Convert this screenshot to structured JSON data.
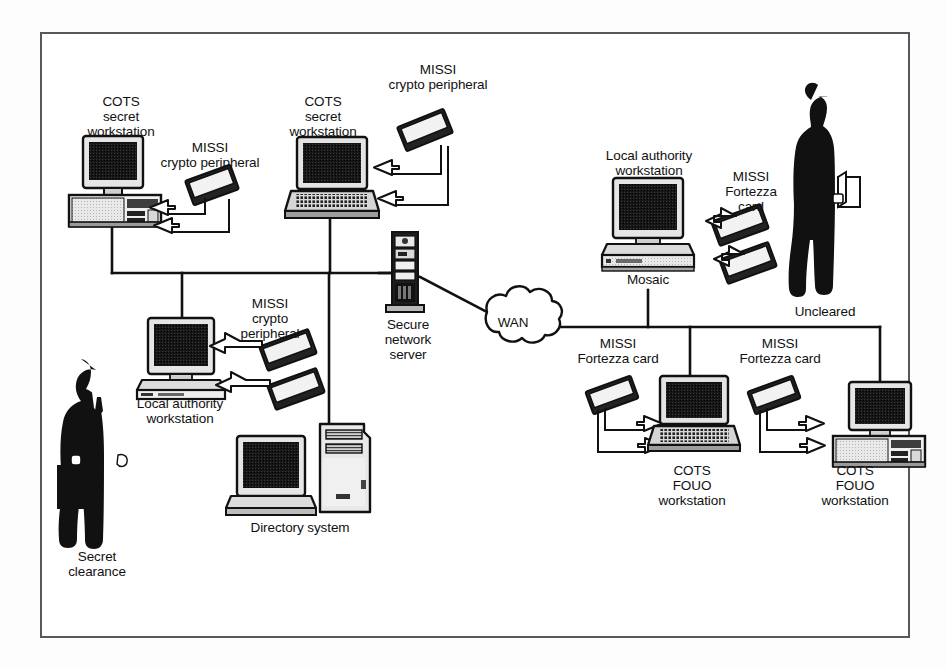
{
  "diagram": {
    "frame": {
      "border_color": "#55585c",
      "background": "#ffffff"
    },
    "ink_color": "#111111",
    "nodes": [
      {
        "id": "cots-secret-ws-desktop",
        "label": "COTS\nsecret\nworkstation",
        "type": "desktop-computer",
        "x": 120,
        "y": 182
      },
      {
        "id": "missi-crypto-1",
        "label": "MISSI\ncrypto peripheral",
        "type": "crypto-card",
        "x": 212,
        "y": 185
      },
      {
        "id": "cots-secret-ws-laptop",
        "label": "COTS\nsecret\nworkstation",
        "type": "laptop-computer",
        "x": 330,
        "y": 175
      },
      {
        "id": "missi-crypto-2",
        "label": "MISSI\ncrypto peripheral",
        "type": "crypto-card",
        "x": 425,
        "y": 130
      },
      {
        "id": "local-authority-ws-left",
        "label": "Local authority\nworkstation",
        "type": "desktop-computer",
        "x": 180,
        "y": 360
      },
      {
        "id": "missi-crypto-3",
        "label": "MISSI\ncrypto\nperipheral",
        "type": "crypto-card-pair",
        "x": 290,
        "y": 360
      },
      {
        "id": "directory-system",
        "label": "Directory system",
        "type": "tower-computer",
        "x": 300,
        "y": 470
      },
      {
        "id": "secure-network-server",
        "label": "Secure\nnetwork\nserver",
        "type": "rack-server",
        "x": 405,
        "y": 265
      },
      {
        "id": "wan-cloud",
        "label": "WAN",
        "type": "cloud",
        "x": 513,
        "y": 322
      },
      {
        "id": "local-authority-ws-right",
        "label": "Local authority\nworkstation",
        "type": "desktop-computer",
        "x": 646,
        "y": 225
      },
      {
        "id": "mosaic",
        "label": "Mosaic",
        "type": "caption",
        "x": 648,
        "y": 281
      },
      {
        "id": "missi-fortezza-1",
        "label": "MISSI\nFortezza\ncard",
        "type": "crypto-card-pair",
        "x": 735,
        "y": 215
      },
      {
        "id": "uncleared-person",
        "label": "Uncleared",
        "type": "person-silhouette",
        "x": 825,
        "y": 200
      },
      {
        "id": "secret-clearance-person",
        "label": "Secret\nclearance",
        "type": "person-silhouette",
        "x": 95,
        "y": 440
      },
      {
        "id": "missi-fortezza-2",
        "label": "MISSI\nFortezza card",
        "type": "crypto-card",
        "x": 612,
        "y": 370
      },
      {
        "id": "cots-fouo-ws-laptop",
        "label": "COTS\nFOUO\nworkstation",
        "type": "laptop-computer",
        "x": 690,
        "y": 425
      },
      {
        "id": "missi-fortezza-3",
        "label": "MISSI\nFortezza card",
        "type": "crypto-card",
        "x": 775,
        "y": 370
      },
      {
        "id": "cots-fouo-ws-desktop",
        "label": "COTS\nFOUO\nworkstation",
        "type": "desktop-computer",
        "x": 855,
        "y": 425
      }
    ],
    "labels": [
      {
        "name": "label-cots-secret-workstation-left",
        "text": "COTS\nsecret\nworkstation",
        "left": 66,
        "top": 94,
        "width": 110
      },
      {
        "name": "label-missi-crypto-peripheral-1",
        "text": "MISSI\ncrypto peripheral",
        "left": 140,
        "top": 140,
        "width": 140
      },
      {
        "name": "label-cots-secret-workstation-mid",
        "text": "COTS\nsecret\nworkstation",
        "left": 268,
        "top": 94,
        "width": 110
      },
      {
        "name": "label-missi-crypto-peripheral-2",
        "text": "MISSI\ncrypto peripheral",
        "left": 368,
        "top": 62,
        "width": 140
      },
      {
        "name": "label-missi-crypto-peripheral-3",
        "text": "MISSI\ncrypto\nperipheral",
        "left": 222,
        "top": 296,
        "width": 96
      },
      {
        "name": "label-local-authority-workstation-left",
        "text": "Local authority\nworkstation",
        "left": 118,
        "top": 396,
        "width": 124
      },
      {
        "name": "label-directory-system",
        "text": "Directory system",
        "left": 224,
        "top": 520,
        "width": 152
      },
      {
        "name": "label-secure-network-server",
        "text": "Secure\nnetwork\nserver",
        "left": 368,
        "top": 317,
        "width": 80
      },
      {
        "name": "label-wan",
        "text": "WAN",
        "left": 487,
        "top": 315,
        "width": 52
      },
      {
        "name": "label-local-authority-workstation-right",
        "text": "Local authority\nworkstation",
        "left": 588,
        "top": 148,
        "width": 122
      },
      {
        "name": "label-missi-fortezza-card-1",
        "text": "MISSI\nFortezza\ncard",
        "left": 715,
        "top": 169,
        "width": 72
      },
      {
        "name": "label-mosaic",
        "text": "Mosaic",
        "left": 618,
        "top": 272,
        "width": 60
      },
      {
        "name": "label-uncleared",
        "text": "Uncleared",
        "left": 784,
        "top": 304,
        "width": 82
      },
      {
        "name": "label-secret-clearance",
        "text": "Secret\nclearance",
        "left": 52,
        "top": 549,
        "width": 90
      },
      {
        "name": "label-missi-fortezza-card-2",
        "text": "MISSI\nFortezza card",
        "left": 566,
        "top": 336,
        "width": 104
      },
      {
        "name": "label-cots-fouo-workstation-1",
        "text": "COTS\nFOUO\nworkstation",
        "left": 637,
        "top": 463,
        "width": 110
      },
      {
        "name": "label-missi-fortezza-card-3",
        "text": "MISSI\nFortezza card",
        "left": 728,
        "top": 336,
        "width": 104
      },
      {
        "name": "label-cots-fouo-workstation-2",
        "text": "COTS\nFOUO\nworkstation",
        "left": 800,
        "top": 463,
        "width": 110
      }
    ],
    "connections": [
      {
        "from": "cots-secret-ws-desktop",
        "to": "left-bus"
      },
      {
        "from": "cots-secret-ws-laptop",
        "to": "left-bus"
      },
      {
        "from": "left-bus",
        "to": "local-authority-ws-left"
      },
      {
        "from": "left-bus",
        "to": "directory-system"
      },
      {
        "from": "left-bus",
        "to": "secure-network-server"
      },
      {
        "from": "secure-network-server",
        "to": "wan-cloud"
      },
      {
        "from": "wan-cloud",
        "to": "right-bus"
      },
      {
        "from": "right-bus",
        "to": "local-authority-ws-right"
      },
      {
        "from": "right-bus",
        "to": "cots-fouo-ws-laptop"
      },
      {
        "from": "right-bus",
        "to": "cots-fouo-ws-desktop"
      }
    ]
  }
}
